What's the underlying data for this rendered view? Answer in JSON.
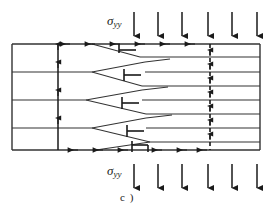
{
  "figure": {
    "caption": "c )",
    "type": "edge-dislocation-pile-up-schematic",
    "top_stress_label": "σ",
    "top_stress_subscript": "yy",
    "bottom_stress_label": "σ",
    "bottom_stress_subscript": "yy"
  },
  "geometry": {
    "crystal_box": {
      "x": 12,
      "y": 44,
      "width": 248,
      "height": 106
    },
    "left_lattice_line_count": 3,
    "right_lattice_line_count": 7,
    "dislocation_count": 5,
    "glide_plane_x": 58,
    "pileup_wall_x": 210
  },
  "stress_arrows": {
    "top_direction": "down",
    "bottom_direction": "up",
    "top_count": 6,
    "bottom_count": 6,
    "top_x_positions": [
      134,
      158,
      182,
      208,
      232,
      257
    ],
    "bottom_x_positions": [
      134,
      158,
      182,
      208,
      232,
      257
    ],
    "top_y_start": 12,
    "top_y_end": 38,
    "bottom_y_start": 186,
    "bottom_y_end": 160
  },
  "lattice": {
    "left_line_y": [
      72,
      100,
      128
    ],
    "right_line_y": [
      57,
      72,
      86,
      100,
      114,
      128,
      142
    ],
    "box_top_y": 44,
    "box_bottom_y": 150,
    "box_left_x": 12,
    "box_right_x": 260
  },
  "dislocations": [
    {
      "id": "dislocation-1",
      "tip_x": 110,
      "symbol_x": 124,
      "y": 46,
      "wedge_start_x": 92,
      "wedge_end_x": 140,
      "upper_y": 44,
      "lower_y": 57
    },
    {
      "id": "dislocation-2",
      "tip_x": 110,
      "symbol_x": 127,
      "y": 72,
      "wedge_start_x": 92,
      "wedge_end_x": 145,
      "upper_y": 72,
      "lower_y": 86
    },
    {
      "id": "dislocation-3",
      "tip_x": 104,
      "symbol_x": 124,
      "y": 100,
      "wedge_start_x": 86,
      "wedge_end_x": 142,
      "upper_y": 100,
      "lower_y": 114
    },
    {
      "id": "dislocation-4",
      "tip_x": 110,
      "symbol_x": 128,
      "y": 128,
      "wedge_start_x": 92,
      "wedge_end_x": 146,
      "upper_y": 128,
      "lower_y": 142
    },
    {
      "id": "dislocation-5",
      "tip_x": 114,
      "symbol_x": 133,
      "y": 148,
      "wedge_start_x": 96,
      "wedge_end_x": 150,
      "upper_y": 142,
      "lower_y": 150
    }
  ],
  "edge_markers": {
    "top_edge_direction": "left",
    "top_edge_x_positions": [
      63,
      88,
      113,
      138,
      163,
      188
    ],
    "bottom_edge_direction": "right",
    "bottom_edge_x_positions": [
      78,
      103,
      128,
      148,
      180,
      200
    ],
    "glide_plane_marker_y": [
      62,
      86,
      110,
      134
    ],
    "wall_marker_y": [
      52,
      66,
      80,
      94,
      108,
      122,
      136
    ]
  },
  "colors": {
    "ink": "#1a1a1a",
    "line": "#333333",
    "background": "#ffffff"
  }
}
